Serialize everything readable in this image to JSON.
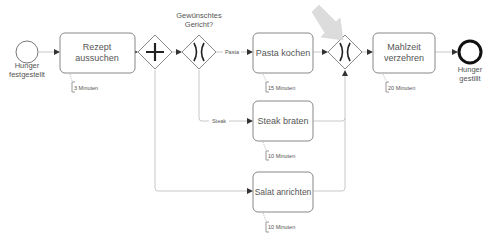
{
  "diagram": {
    "type": "BPMN process",
    "start_event": {
      "label_line1": "Hunger",
      "label_line2": "festgestellt"
    },
    "end_event": {
      "label_line1": "Hunger",
      "label_line2": "gestillt"
    },
    "tasks": {
      "rezept": {
        "line1": "Rezept",
        "line2": "aussuchen",
        "duration": "3 Minuten"
      },
      "pasta": {
        "label": "Pasta kochen",
        "duration": "15 Minuten"
      },
      "steak": {
        "label": "Steak braten",
        "duration": "10 Minuten"
      },
      "salat": {
        "label": "Salat anrichten",
        "duration": "10 Minuten"
      },
      "mahlzeit": {
        "line1": "Mahlzeit",
        "line2": "verzehren",
        "duration": "20 Minuten"
      }
    },
    "gateways": {
      "parallel_split": {
        "kind": "parallel",
        "symbol": "+"
      },
      "xor_split": {
        "kind": "exclusive",
        "symbol": "X",
        "label_line1": "Gewünschtes",
        "label_line2": "Gericht?"
      },
      "xor_merge": {
        "kind": "exclusive",
        "symbol": "X",
        "highlighted_by": "gray-arrow"
      }
    },
    "flow_labels": {
      "pasta": "Pasta",
      "steak": "Steak"
    },
    "colors": {
      "stroke": "#7a7a7a",
      "line": "#c8c8c8",
      "text": "#555555",
      "pointer_arrow": "#d6d6d6"
    }
  }
}
